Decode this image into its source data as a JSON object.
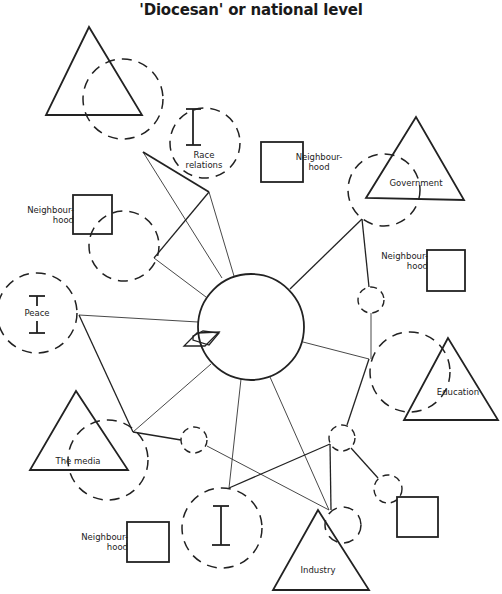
{
  "title": "'Diocesan' or national level",
  "labels": {
    "race_relations_line1": "Race",
    "race_relations_line2": "relations",
    "neighbourhood_line1": "Neighbour-",
    "neighbourhood_line2": "hood",
    "government": "Government",
    "peace": "Peace",
    "education": "Education",
    "the_media": "The media",
    "industry": "Industry"
  },
  "nodes": [
    {
      "id": "centre",
      "shape": "circle",
      "style": "solid"
    },
    {
      "id": "top-left-triangle",
      "shape": "triangle",
      "label": ""
    },
    {
      "id": "race-relations",
      "shape": "dashed-circle",
      "label": "Race relations"
    },
    {
      "id": "neighbourhood-top",
      "shape": "square",
      "label": "Neighbourhood"
    },
    {
      "id": "government",
      "shape": "triangle",
      "label": "Government"
    },
    {
      "id": "neighbourhood-left",
      "shape": "square",
      "label": "Neighbourhood"
    },
    {
      "id": "neighbourhood-right",
      "shape": "square",
      "label": "Neighbourhood"
    },
    {
      "id": "peace",
      "shape": "dashed-circle",
      "label": "Peace"
    },
    {
      "id": "education",
      "shape": "triangle",
      "label": "Education"
    },
    {
      "id": "the-media",
      "shape": "triangle",
      "label": "The media"
    },
    {
      "id": "neighbourhood-bottom",
      "shape": "square",
      "label": "Neighbourhood"
    },
    {
      "id": "industry",
      "shape": "triangle",
      "label": "Industry"
    },
    {
      "id": "bottom-right-square",
      "shape": "square",
      "label": ""
    }
  ]
}
